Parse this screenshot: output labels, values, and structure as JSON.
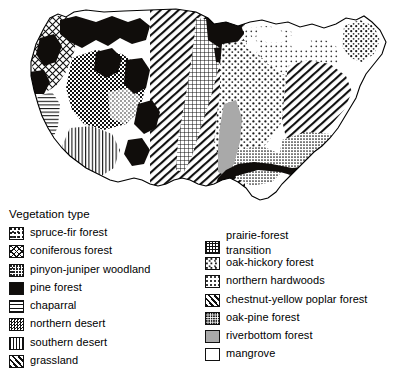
{
  "map": {
    "title": "Vegetation map of the United States",
    "regions_depicted": [
      "Pacific Northwest coniferous forest",
      "Western mountain pine forest",
      "Great Basin northern desert",
      "Southwest southern desert",
      "Great Plains grassland",
      "Midwest oak-hickory forest",
      "Appalachian chestnut-yellow poplar forest",
      "Southeastern coastal pine forest",
      "Northern New England spruce-fir forest",
      "Florida mangrove"
    ]
  },
  "legend": {
    "title": "Vegetation type",
    "left_column": [
      {
        "label": "spruce-fir forest",
        "pattern": "p-sprucefir",
        "swatch": "stipple-medium"
      },
      {
        "label": "coniferous forest",
        "pattern": "p-coniferous",
        "swatch": "diamond-grid"
      },
      {
        "label": "pinyon-juniper woodland",
        "pattern": "p-pinyon",
        "swatch": "fine-dots"
      },
      {
        "label": "pine forest",
        "pattern": "p-pine",
        "swatch": "solid-black"
      },
      {
        "label": "chaparral",
        "pattern": "p-chaparral",
        "swatch": "horizontal-lines"
      },
      {
        "label": "northern desert",
        "pattern": "p-ndesert",
        "swatch": "checkerboard"
      },
      {
        "label": "southern desert",
        "pattern": "p-sdesert",
        "swatch": "vertical-lines"
      },
      {
        "label": "grassland",
        "pattern": "p-grassland",
        "swatch": "diagonal-hatch"
      }
    ],
    "right_column": [
      {
        "label": "prairie-forest\ntransition",
        "pattern": "p-prairie",
        "swatch": "square-grid",
        "two_line": true
      },
      {
        "label": "oak-hickory forest",
        "pattern": "p-oakhickory",
        "swatch": "stipple-coarse"
      },
      {
        "label": "northern hardwoods",
        "pattern": "p-nhardwoods",
        "swatch": "stipple-light"
      },
      {
        "label": "chestnut-yellow poplar forest",
        "pattern": "p-chestnut",
        "swatch": "diagonal-hatch"
      },
      {
        "label": "oak-pine forest",
        "pattern": "p-oakpine",
        "swatch": "dense-stipple"
      },
      {
        "label": "riverbottom forest",
        "pattern": "p-riverbottom",
        "swatch": "solid-gray"
      },
      {
        "label": "mangrove",
        "pattern": "p-mangrove",
        "swatch": "white-empty"
      }
    ]
  },
  "colors": {
    "ink": "#000000",
    "background": "#ffffff",
    "gray": "#a9a9a9",
    "black_fill": "#100d0b"
  }
}
